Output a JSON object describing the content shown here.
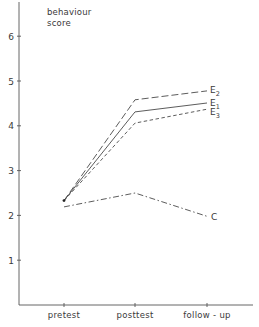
{
  "chart_data": {
    "type": "line",
    "title": "",
    "ylabel": "behaviour score",
    "ylabel_lines": [
      "behaviour",
      "score"
    ],
    "xlabel": "",
    "categories": [
      "pretest",
      "posttest",
      "follow - up"
    ],
    "ylim": [
      0,
      6.5
    ],
    "yticks": [
      1,
      2,
      3,
      4,
      5,
      6
    ],
    "grid": false,
    "legend_position": "inline labels at line ends (right)",
    "series": [
      {
        "name": "E2",
        "label_main": "E",
        "label_sub": "2",
        "style": "long-dash",
        "values": [
          2.33,
          4.58,
          4.78
        ]
      },
      {
        "name": "E1",
        "label_main": "E",
        "label_sub": "1",
        "style": "solid",
        "values": [
          2.33,
          4.31,
          4.51
        ]
      },
      {
        "name": "E3",
        "label_main": "E",
        "label_sub": "3",
        "style": "short-dash",
        "values": [
          2.33,
          4.06,
          4.37
        ]
      },
      {
        "name": "C",
        "label_main": "C",
        "label_sub": "",
        "style": "dash-dot",
        "values": [
          2.19,
          2.5,
          1.98
        ]
      }
    ]
  }
}
